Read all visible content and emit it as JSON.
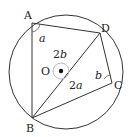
{
  "figure": {
    "points": {
      "A": {
        "label": "A"
      },
      "B": {
        "label": "B"
      },
      "C": {
        "label": "C"
      },
      "D": {
        "label": "D"
      },
      "O": {
        "label": "O"
      }
    },
    "angles": {
      "at_A": {
        "label": "a"
      },
      "at_C": {
        "label": "b"
      },
      "central_reflex": {
        "label": "2b"
      },
      "central": {
        "label": "2a"
      }
    }
  },
  "colors": {
    "line": "#333333",
    "background": "#ffffff",
    "center_ring": "#bbbbbb"
  }
}
